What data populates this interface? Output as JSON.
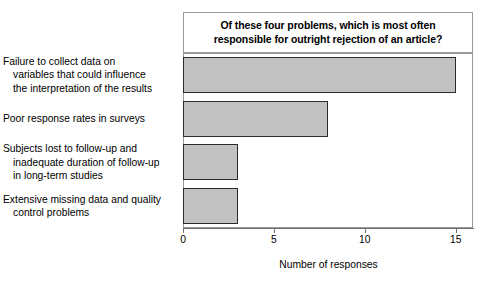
{
  "chart_data": {
    "type": "bar",
    "orientation": "horizontal",
    "title": "Of these four problems, which is most often\nresponsible for outright rejection of an article?",
    "xlabel": "Number of responses",
    "ylabel": "",
    "categories": [
      "Failure to collect data on\nvariables that could influence\nthe interpretation of the results",
      "Poor response rates in surveys",
      "Subjects lost to follow-up and\ninadequate duration of follow-up\nin long-term studies",
      "Extensive missing data and quality\ncontrol problems"
    ],
    "values": [
      15,
      8,
      3,
      3
    ],
    "xlim": [
      0,
      15.95
    ],
    "xticks": [
      0,
      5,
      10,
      15
    ],
    "xtick_labels": [
      "0",
      "5",
      "10",
      "15"
    ],
    "grid": false,
    "legend": false,
    "bar_fill_color": "#c2c2c2",
    "bar_edge_color": "#2b2b2b",
    "frame_color": "#9a9a9a",
    "axis_color": "#6e6e6e",
    "text_color": "#000000"
  }
}
